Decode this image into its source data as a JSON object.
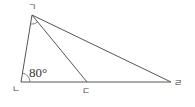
{
  "diagram": {
    "type": "geometry-triangle",
    "vertices": [
      {
        "id": "A",
        "label": "ㄱ",
        "x": 32,
        "y": 15
      },
      {
        "id": "B",
        "label": "ㄴ",
        "x": 21,
        "y": 82
      },
      {
        "id": "C",
        "label": "ㄷ",
        "x": 87,
        "y": 82
      },
      {
        "id": "D",
        "label": "ㄹ",
        "x": 171,
        "y": 82
      }
    ],
    "segments": [
      [
        "ㄱ",
        "ㄴ"
      ],
      [
        "ㄴ",
        "ㄹ"
      ],
      [
        "ㄱ",
        "ㄹ"
      ],
      [
        "ㄱ",
        "ㄷ"
      ]
    ],
    "angles": [
      {
        "vertex": "ㄴ",
        "between": [
          "ㄱ",
          "ㄷ"
        ],
        "value": "80°"
      },
      {
        "vertex": "ㄱ",
        "between": [
          "ㄴ",
          "ㄷ"
        ],
        "value": ""
      }
    ],
    "labels": {
      "a": "ㄱ",
      "b": "ㄴ",
      "c": "ㄷ",
      "d": "ㄹ",
      "angle_b": "80°"
    },
    "colors": {
      "line": "#555555",
      "text": "#444444",
      "background": "#ffffff"
    }
  }
}
